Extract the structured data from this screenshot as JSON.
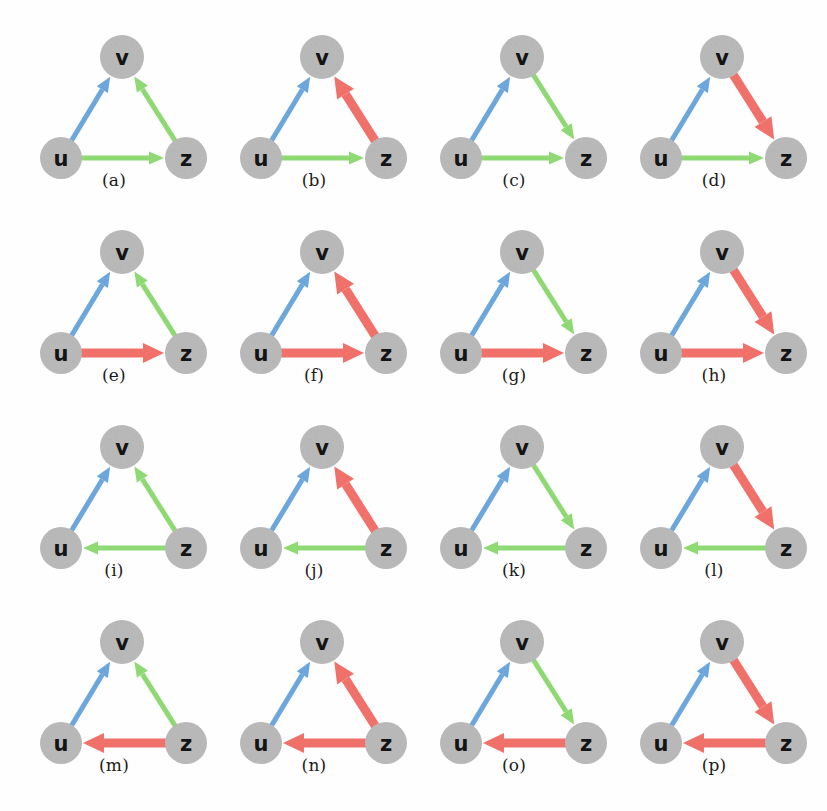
{
  "figure": {
    "title": "",
    "nodes": {
      "v": {
        "label": "v",
        "cx": 108,
        "cy": 47,
        "r": 22
      },
      "u": {
        "label": "u",
        "cx": 47,
        "cy": 148,
        "r": 21
      },
      "z": {
        "label": "z",
        "cx": 172,
        "cy": 148,
        "r": 21
      }
    },
    "colors": {
      "node_fill": "#b2b2b2",
      "node_text": "#141414",
      "blue": "#6ba6dd",
      "green": "#8ed973",
      "red": "#f0706a",
      "background": "#fefefe",
      "caption_text": "#1c1c1c"
    },
    "legend_meaning": {
      "blue": "blue edge",
      "green": "green edge",
      "red": "red edge",
      "thin": "thin arrow",
      "thick": "thick arrow"
    }
  },
  "chart_data": {
    "type": "diagram",
    "node_names": [
      "u",
      "v",
      "z"
    ],
    "edge_colors": [
      "blue",
      "green",
      "red"
    ],
    "panels": [
      {
        "id": "a",
        "caption": "(a)",
        "edges": [
          {
            "from": "u",
            "to": "v",
            "color": "blue",
            "weight": "thin"
          },
          {
            "from": "z",
            "to": "v",
            "color": "green",
            "weight": "thin"
          },
          {
            "from": "u",
            "to": "z",
            "color": "green",
            "weight": "thin"
          }
        ]
      },
      {
        "id": "b",
        "caption": "(b)",
        "edges": [
          {
            "from": "u",
            "to": "v",
            "color": "blue",
            "weight": "thin"
          },
          {
            "from": "z",
            "to": "v",
            "color": "red",
            "weight": "thick"
          },
          {
            "from": "u",
            "to": "z",
            "color": "green",
            "weight": "thin"
          }
        ]
      },
      {
        "id": "c",
        "caption": "(c)",
        "edges": [
          {
            "from": "u",
            "to": "v",
            "color": "blue",
            "weight": "thin"
          },
          {
            "from": "v",
            "to": "z",
            "color": "green",
            "weight": "thin"
          },
          {
            "from": "u",
            "to": "z",
            "color": "green",
            "weight": "thin"
          }
        ]
      },
      {
        "id": "d",
        "caption": "(d)",
        "edges": [
          {
            "from": "u",
            "to": "v",
            "color": "blue",
            "weight": "thin"
          },
          {
            "from": "v",
            "to": "z",
            "color": "red",
            "weight": "thick"
          },
          {
            "from": "u",
            "to": "z",
            "color": "green",
            "weight": "thin"
          }
        ]
      },
      {
        "id": "e",
        "caption": "(e)",
        "edges": [
          {
            "from": "u",
            "to": "v",
            "color": "blue",
            "weight": "thin"
          },
          {
            "from": "z",
            "to": "v",
            "color": "green",
            "weight": "thin"
          },
          {
            "from": "u",
            "to": "z",
            "color": "red",
            "weight": "thick"
          }
        ]
      },
      {
        "id": "f",
        "caption": "(f)",
        "edges": [
          {
            "from": "u",
            "to": "v",
            "color": "blue",
            "weight": "thin"
          },
          {
            "from": "z",
            "to": "v",
            "color": "red",
            "weight": "thick"
          },
          {
            "from": "u",
            "to": "z",
            "color": "red",
            "weight": "thick"
          }
        ]
      },
      {
        "id": "g",
        "caption": "(g)",
        "edges": [
          {
            "from": "u",
            "to": "v",
            "color": "blue",
            "weight": "thin"
          },
          {
            "from": "v",
            "to": "z",
            "color": "green",
            "weight": "thin"
          },
          {
            "from": "u",
            "to": "z",
            "color": "red",
            "weight": "thick"
          }
        ]
      },
      {
        "id": "h",
        "caption": "(h)",
        "edges": [
          {
            "from": "u",
            "to": "v",
            "color": "blue",
            "weight": "thin"
          },
          {
            "from": "v",
            "to": "z",
            "color": "red",
            "weight": "thick"
          },
          {
            "from": "u",
            "to": "z",
            "color": "red",
            "weight": "thick"
          }
        ]
      },
      {
        "id": "i",
        "caption": "(i)",
        "edges": [
          {
            "from": "u",
            "to": "v",
            "color": "blue",
            "weight": "thin"
          },
          {
            "from": "z",
            "to": "v",
            "color": "green",
            "weight": "thin"
          },
          {
            "from": "z",
            "to": "u",
            "color": "green",
            "weight": "thin"
          }
        ]
      },
      {
        "id": "j",
        "caption": "(j)",
        "edges": [
          {
            "from": "u",
            "to": "v",
            "color": "blue",
            "weight": "thin"
          },
          {
            "from": "z",
            "to": "v",
            "color": "red",
            "weight": "thick"
          },
          {
            "from": "z",
            "to": "u",
            "color": "green",
            "weight": "thin"
          }
        ]
      },
      {
        "id": "k",
        "caption": "(k)",
        "edges": [
          {
            "from": "u",
            "to": "v",
            "color": "blue",
            "weight": "thin"
          },
          {
            "from": "v",
            "to": "z",
            "color": "green",
            "weight": "thin"
          },
          {
            "from": "z",
            "to": "u",
            "color": "green",
            "weight": "thin"
          }
        ]
      },
      {
        "id": "l",
        "caption": "(l)",
        "edges": [
          {
            "from": "u",
            "to": "v",
            "color": "blue",
            "weight": "thin"
          },
          {
            "from": "v",
            "to": "z",
            "color": "red",
            "weight": "thick"
          },
          {
            "from": "z",
            "to": "u",
            "color": "green",
            "weight": "thin"
          }
        ]
      },
      {
        "id": "m",
        "caption": "(m)",
        "edges": [
          {
            "from": "u",
            "to": "v",
            "color": "blue",
            "weight": "thin"
          },
          {
            "from": "z",
            "to": "v",
            "color": "green",
            "weight": "thin"
          },
          {
            "from": "z",
            "to": "u",
            "color": "red",
            "weight": "thick"
          }
        ]
      },
      {
        "id": "n",
        "caption": "(n)",
        "edges": [
          {
            "from": "u",
            "to": "v",
            "color": "blue",
            "weight": "thin"
          },
          {
            "from": "z",
            "to": "v",
            "color": "red",
            "weight": "thick"
          },
          {
            "from": "z",
            "to": "u",
            "color": "red",
            "weight": "thick"
          }
        ]
      },
      {
        "id": "o",
        "caption": "(o)",
        "edges": [
          {
            "from": "u",
            "to": "v",
            "color": "blue",
            "weight": "thin"
          },
          {
            "from": "v",
            "to": "z",
            "color": "green",
            "weight": "thin"
          },
          {
            "from": "z",
            "to": "u",
            "color": "red",
            "weight": "thick"
          }
        ]
      },
      {
        "id": "p",
        "caption": "(p)",
        "edges": [
          {
            "from": "u",
            "to": "v",
            "color": "blue",
            "weight": "thin"
          },
          {
            "from": "v",
            "to": "z",
            "color": "red",
            "weight": "thick"
          },
          {
            "from": "z",
            "to": "u",
            "color": "red",
            "weight": "thick"
          }
        ]
      }
    ]
  }
}
